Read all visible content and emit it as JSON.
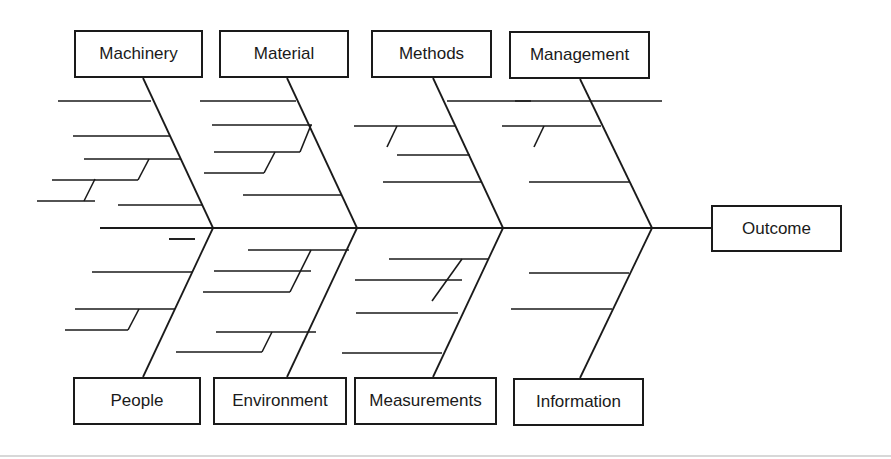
{
  "diagram": {
    "type": "fishbone (Ishikawa) cause-and-effect diagram",
    "outcome": {
      "label": "Outcome",
      "x": 711,
      "y": 205,
      "w": 131,
      "h": 47
    },
    "spine": {
      "x1": 100,
      "y1": 228,
      "x2": 712,
      "y2": 228
    },
    "colors": {
      "line": "#1a1a1a",
      "background": "#ffffff",
      "rule": "#d8d8d8"
    },
    "top_categories": [
      {
        "label": "Machinery",
        "box": {
          "x": 74,
          "y": 30,
          "w": 129,
          "h": 48
        },
        "bone": {
          "x1": 143,
          "y1": 78,
          "x2": 213,
          "y2": 228
        }
      },
      {
        "label": "Material",
        "box": {
          "x": 219,
          "y": 30,
          "w": 130,
          "h": 48
        },
        "bone": {
          "x1": 287,
          "y1": 78,
          "x2": 357,
          "y2": 228
        }
      },
      {
        "label": "Methods",
        "box": {
          "x": 371,
          "y": 30,
          "w": 121,
          "h": 48
        },
        "bone": {
          "x1": 433,
          "y1": 78,
          "x2": 503,
          "y2": 228
        }
      },
      {
        "label": "Management",
        "box": {
          "x": 509,
          "y": 31,
          "w": 141,
          "h": 48
        },
        "bone": {
          "x1": 580,
          "y1": 79,
          "x2": 652,
          "y2": 228
        }
      }
    ],
    "bottom_categories": [
      {
        "label": "People",
        "box": {
          "x": 73,
          "y": 377,
          "w": 128,
          "h": 48
        },
        "bone": {
          "x1": 143,
          "y1": 377,
          "x2": 213,
          "y2": 228
        }
      },
      {
        "label": "Environment",
        "box": {
          "x": 213,
          "y": 377,
          "w": 134,
          "h": 48
        },
        "bone": {
          "x1": 287,
          "y1": 377,
          "x2": 357,
          "y2": 228
        }
      },
      {
        "label": "Measurements",
        "box": {
          "x": 354,
          "y": 377,
          "w": 143,
          "h": 48
        },
        "bone": {
          "x1": 433,
          "y1": 377,
          "x2": 503,
          "y2": 228
        }
      },
      {
        "label": "Information",
        "box": {
          "x": 513,
          "y": 378,
          "w": 131,
          "h": 48
        },
        "bone": {
          "x1": 580,
          "y1": 378,
          "x2": 652,
          "y2": 228
        }
      }
    ],
    "ribs": [
      [
        58,
        101,
        151,
        101
      ],
      [
        73,
        136,
        170,
        136
      ],
      [
        84,
        159,
        181,
        159
      ],
      [
        52,
        180,
        138,
        180
      ],
      [
        37,
        201,
        95,
        201
      ],
      [
        118,
        205,
        202,
        205
      ],
      [
        95,
        179,
        84,
        201
      ],
      [
        149,
        159,
        138,
        180
      ],
      [
        200,
        101,
        296,
        101
      ],
      [
        212,
        125,
        312,
        125
      ],
      [
        214,
        152,
        300,
        152
      ],
      [
        204,
        173,
        264,
        173
      ],
      [
        243,
        195,
        342,
        195
      ],
      [
        311,
        125,
        300,
        152
      ],
      [
        275,
        152,
        264,
        173
      ],
      [
        447,
        101,
        531,
        101
      ],
      [
        354,
        126,
        455,
        126
      ],
      [
        397,
        155,
        470,
        155
      ],
      [
        383,
        182,
        482,
        182
      ],
      [
        397,
        126,
        387,
        147
      ],
      [
        515,
        101,
        662,
        101
      ],
      [
        502,
        126,
        601,
        126
      ],
      [
        529,
        182,
        629,
        182
      ],
      [
        544,
        126,
        534,
        147
      ],
      [
        169,
        239,
        195,
        239
      ],
      [
        169,
        239,
        195,
        239
      ],
      [
        92,
        272,
        192,
        272
      ],
      [
        75,
        309,
        175,
        309
      ],
      [
        65,
        330,
        128,
        330
      ],
      [
        139,
        309,
        128,
        330
      ],
      [
        248,
        250,
        349,
        250
      ],
      [
        214,
        271,
        311,
        271
      ],
      [
        203,
        292,
        290,
        292
      ],
      [
        311,
        250,
        290,
        292
      ],
      [
        216,
        332,
        316,
        332
      ],
      [
        176,
        352,
        262,
        352
      ],
      [
        272,
        332,
        262,
        352
      ],
      [
        389,
        259,
        488,
        259
      ],
      [
        355,
        280,
        462,
        280
      ],
      [
        462,
        259,
        432,
        301
      ],
      [
        356,
        313,
        458,
        313
      ],
      [
        342,
        353,
        442,
        353
      ],
      [
        529,
        273,
        629,
        273
      ],
      [
        511,
        309,
        612,
        309
      ]
    ],
    "bottom_rule": {
      "y": 455
    }
  }
}
